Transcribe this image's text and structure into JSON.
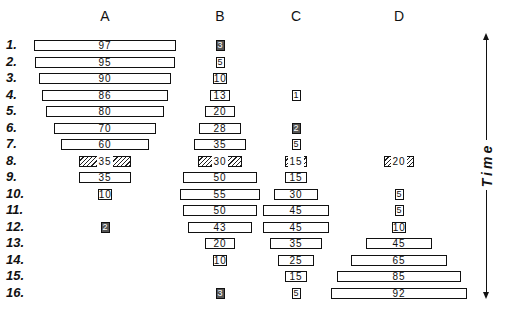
{
  "chart_data": {
    "type": "battleship",
    "title": "",
    "columns": [
      "A",
      "B",
      "C",
      "D"
    ],
    "rows": [
      "1.",
      "2.",
      "3.",
      "4.",
      "5.",
      "6.",
      "7.",
      "8.",
      "9.",
      "10.",
      "11.",
      "12.",
      "13.",
      "14.",
      "15.",
      "16."
    ],
    "series": [
      {
        "name": "A",
        "values": [
          97,
          95,
          90,
          86,
          80,
          70,
          60,
          35,
          35,
          10,
          null,
          2,
          null,
          null,
          null,
          null
        ]
      },
      {
        "name": "B",
        "values": [
          3,
          5,
          10,
          13,
          20,
          28,
          35,
          30,
          50,
          55,
          50,
          43,
          20,
          10,
          null,
          3
        ]
      },
      {
        "name": "C",
        "values": [
          null,
          null,
          null,
          1,
          null,
          2,
          5,
          15,
          15,
          30,
          45,
          45,
          35,
          25,
          15,
          5
        ]
      },
      {
        "name": "D",
        "values": [
          null,
          null,
          null,
          null,
          null,
          null,
          null,
          20,
          null,
          5,
          5,
          10,
          45,
          65,
          85,
          92
        ]
      }
    ],
    "highlighted_row": "8.",
    "highlight_style": "hatched",
    "axis_label": "Time",
    "axis_direction": "vertical, arrows at both ends"
  },
  "headers": [
    "A",
    "B",
    "C",
    "D"
  ],
  "row_labels": [
    "1.",
    "2.",
    "3.",
    "4.",
    "5.",
    "6.",
    "7.",
    "8.",
    "9.",
    "10.",
    "11.",
    "12.",
    "13.",
    "14.",
    "15.",
    "16."
  ],
  "time_label": "Time"
}
